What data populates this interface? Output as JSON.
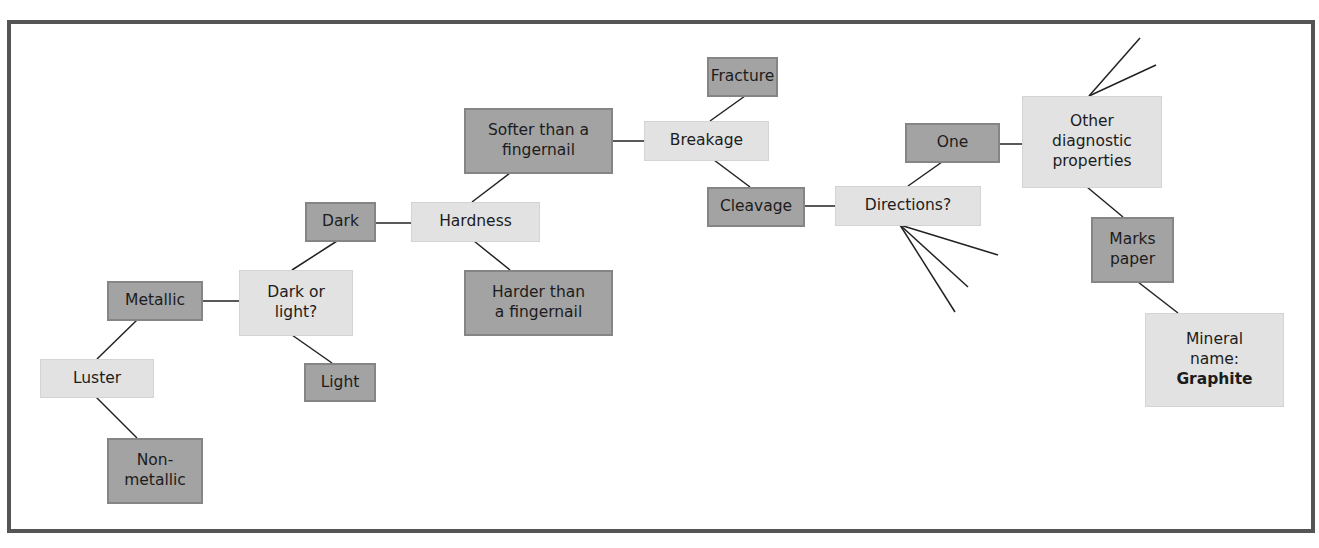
{
  "diagram": {
    "type": "identification-flowchart",
    "colors": {
      "question_fill": "#e2e2e2",
      "answer_fill": "#a3a3a3",
      "answer_border": "#858585",
      "line": "#222222",
      "frame": "#555555"
    },
    "nodes": {
      "luster": {
        "label": "Luster",
        "kind": "question"
      },
      "metallic": {
        "label": "Metallic",
        "kind": "answer"
      },
      "nonmetallic": {
        "label": "Non-\nmetallic",
        "kind": "answer"
      },
      "dark_or_light": {
        "label": "Dark or\nlight?",
        "kind": "question"
      },
      "light": {
        "label": "Light",
        "kind": "answer"
      },
      "dark": {
        "label": "Dark",
        "kind": "answer"
      },
      "hardness": {
        "label": "Hardness",
        "kind": "question"
      },
      "softer": {
        "label": "Softer than a\nfingernail",
        "kind": "answer"
      },
      "harder": {
        "label": "Harder than\na fingernail",
        "kind": "answer"
      },
      "breakage": {
        "label": "Breakage",
        "kind": "question"
      },
      "fracture": {
        "label": "Fracture",
        "kind": "answer"
      },
      "cleavage": {
        "label": "Cleavage",
        "kind": "answer"
      },
      "directions": {
        "label": "Directions?",
        "kind": "question"
      },
      "one": {
        "label": "One",
        "kind": "answer"
      },
      "other_diagnostic": {
        "label": "Other\ndiagnostic\nproperties",
        "kind": "question"
      },
      "marks_paper": {
        "label": "Marks\npaper",
        "kind": "answer"
      },
      "mineral_name": {
        "label": "Mineral\nname:",
        "result": "Graphite",
        "kind": "question"
      }
    },
    "edges": [
      [
        "luster",
        "metallic"
      ],
      [
        "luster",
        "nonmetallic"
      ],
      [
        "metallic",
        "dark_or_light"
      ],
      [
        "dark_or_light",
        "dark"
      ],
      [
        "dark_or_light",
        "light"
      ],
      [
        "dark",
        "hardness"
      ],
      [
        "hardness",
        "softer"
      ],
      [
        "hardness",
        "harder"
      ],
      [
        "softer",
        "breakage"
      ],
      [
        "breakage",
        "fracture"
      ],
      [
        "breakage",
        "cleavage"
      ],
      [
        "cleavage",
        "directions"
      ],
      [
        "directions",
        "one"
      ],
      [
        "one",
        "other_diagnostic"
      ],
      [
        "other_diagnostic",
        "marks_paper"
      ],
      [
        "marks_paper",
        "mineral_name"
      ]
    ],
    "unlabeled_branches": {
      "directions": 3,
      "other_diagnostic": 2
    }
  }
}
